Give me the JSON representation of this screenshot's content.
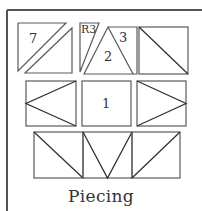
{
  "diagram": {
    "caption": "Piecing",
    "colors": {
      "line": "#5a5a5a",
      "frame": "#555555",
      "text": "#333333",
      "background": "#ffffff"
    },
    "rows": [
      {
        "blocks": [
          {
            "id": "r1b1",
            "type": "square-two-parallel-diagonals",
            "label": "7"
          },
          {
            "id": "r1b2",
            "type": "split-triangle-unit",
            "labels": [
              "R3",
              "2",
              "3"
            ]
          },
          {
            "id": "r1b3",
            "type": "half-square-triangle-tl-br",
            "label": ""
          }
        ]
      },
      {
        "blocks": [
          {
            "id": "r2b1",
            "type": "flying-geese-pointing-left",
            "label": ""
          },
          {
            "id": "r2b2",
            "type": "plain-square",
            "label": "1"
          },
          {
            "id": "r2b3",
            "type": "flying-geese-pointing-right",
            "label": ""
          }
        ]
      },
      {
        "blocks": [
          {
            "id": "r3b1",
            "type": "half-square-triangle-tl-br",
            "label": ""
          },
          {
            "id": "r3b2",
            "type": "triangle-pointing-down",
            "label": ""
          },
          {
            "id": "r3b3",
            "type": "half-square-triangle-tr-bl",
            "label": ""
          }
        ]
      }
    ],
    "labels": {
      "seven": "7",
      "r3": "R3",
      "two": "2",
      "three": "3",
      "one": "1"
    }
  }
}
